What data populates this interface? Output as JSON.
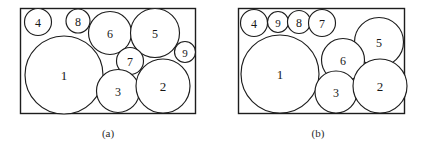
{
  "figure": {
    "background_color": "#ffffff",
    "stroke_color": "#1d1d1d",
    "fill_color": "#ffffff",
    "width": 428,
    "height": 150
  },
  "chart_data": {
    "type": "diagram",
    "subtype": "circle-packing",
    "title": "",
    "panels": [
      {
        "id": "a",
        "caption": "(a)",
        "caption_x": 108,
        "caption_y": 133,
        "frame": {
          "x": 20.5,
          "y": 8.5,
          "width": 175,
          "height": 105
        },
        "circles": [
          {
            "label": "4",
            "cx": 38,
            "cy": 22,
            "r": 13.5,
            "font_size": 12
          },
          {
            "label": "8",
            "cx": 78,
            "cy": 21,
            "r": 12.0,
            "font_size": 12
          },
          {
            "label": "6",
            "cx": 110,
            "cy": 33,
            "r": 21.5,
            "font_size": 12
          },
          {
            "label": "5",
            "cx": 155,
            "cy": 33,
            "r": 24.5,
            "font_size": 12
          },
          {
            "label": "9",
            "cx": 185,
            "cy": 52,
            "r": 10.5,
            "font_size": 11
          },
          {
            "label": "1",
            "cx": 64,
            "cy": 75,
            "r": 39.0,
            "font_size": 13
          },
          {
            "label": "7",
            "cx": 130,
            "cy": 61,
            "r": 13.5,
            "font_size": 12
          },
          {
            "label": "3",
            "cx": 118,
            "cy": 91,
            "r": 21.5,
            "font_size": 12
          },
          {
            "label": "2",
            "cx": 163,
            "cy": 86,
            "r": 27.0,
            "font_size": 13
          }
        ]
      },
      {
        "id": "b",
        "caption": "(b)",
        "caption_x": 318,
        "caption_y": 133,
        "frame": {
          "x": 238.5,
          "y": 8.5,
          "width": 166,
          "height": 105
        },
        "circles": [
          {
            "label": "4",
            "cx": 254,
            "cy": 23,
            "r": 13.5,
            "font_size": 12
          },
          {
            "label": "9",
            "cx": 278,
            "cy": 22,
            "r": 10.5,
            "font_size": 11
          },
          {
            "label": "8",
            "cx": 299,
            "cy": 22,
            "r": 11.5,
            "font_size": 12
          },
          {
            "label": "7",
            "cx": 322,
            "cy": 23,
            "r": 13.5,
            "font_size": 12
          },
          {
            "label": "5",
            "cx": 379,
            "cy": 42,
            "r": 24.5,
            "font_size": 12
          },
          {
            "label": "1",
            "cx": 280,
            "cy": 74,
            "r": 39.0,
            "font_size": 13
          },
          {
            "label": "6",
            "cx": 343,
            "cy": 60,
            "r": 21.5,
            "font_size": 12
          },
          {
            "label": "3",
            "cx": 336,
            "cy": 92,
            "r": 21.0,
            "font_size": 12
          },
          {
            "label": "2",
            "cx": 380,
            "cy": 86,
            "r": 27.0,
            "font_size": 13
          }
        ]
      }
    ]
  }
}
